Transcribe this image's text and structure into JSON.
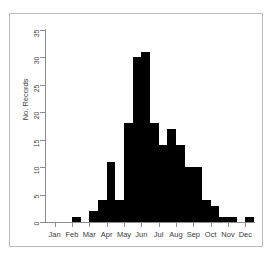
{
  "chart": {
    "type": "bar",
    "title": "",
    "y_axis_title": "No. Records",
    "x_axis_title": ""
  },
  "chart_data": {
    "type": "bar",
    "title": "",
    "xlabel": "",
    "ylabel": "No. Records",
    "ylim": [
      0,
      35
    ],
    "yticks": [
      0,
      5,
      10,
      15,
      20,
      25,
      30,
      35
    ],
    "grid": false,
    "legend": null,
    "xtick_labels": [
      "Jan",
      "Feb",
      "Mar",
      "Apr",
      "May",
      "Jun",
      "Jul",
      "Aug",
      "Sep",
      "Oct",
      "Nov",
      "Dec"
    ],
    "bin_description": "half-month bins across the calendar year",
    "categories": [
      "Jan-1",
      "Jan-2",
      "Feb-1",
      "Feb-2",
      "Mar-1",
      "Mar-2",
      "Apr-1",
      "Apr-2",
      "May-1",
      "May-2",
      "Jun-1",
      "Jun-2",
      "Jul-1",
      "Jul-2",
      "Aug-1",
      "Aug-2",
      "Sep-1",
      "Sep-2",
      "Oct-1",
      "Oct-2",
      "Nov-1",
      "Nov-2",
      "Dec-1",
      "Dec-2"
    ],
    "values": [
      0,
      0,
      0,
      1,
      0,
      2,
      4,
      11,
      4,
      18,
      30,
      31,
      18,
      14,
      17,
      14,
      10,
      10,
      4,
      3,
      1,
      1,
      0,
      1
    ]
  },
  "y_ticks": [
    {
      "value": 35,
      "label": "35"
    },
    {
      "value": 30,
      "label": "30"
    },
    {
      "value": 25,
      "label": "25"
    },
    {
      "value": 20,
      "label": "20"
    },
    {
      "value": 15,
      "label": "15"
    },
    {
      "value": 10,
      "label": "10"
    },
    {
      "value": 5,
      "label": "5"
    },
    {
      "value": 0,
      "label": "0"
    }
  ],
  "x_ticks": [
    {
      "label": "Jan"
    },
    {
      "label": "Feb"
    },
    {
      "label": "Mar"
    },
    {
      "label": "Apr"
    },
    {
      "label": "May"
    },
    {
      "label": "Jun"
    },
    {
      "label": "Jul"
    },
    {
      "label": "Aug"
    },
    {
      "label": "Sep"
    },
    {
      "label": "Oct"
    },
    {
      "label": "Nov"
    },
    {
      "label": "Dec"
    }
  ],
  "colors": {
    "bar": "#000000",
    "axis": "#8c8c8c",
    "frame": "#b9b9b9",
    "background": "#ffffff",
    "text": "#3a3a3a"
  }
}
